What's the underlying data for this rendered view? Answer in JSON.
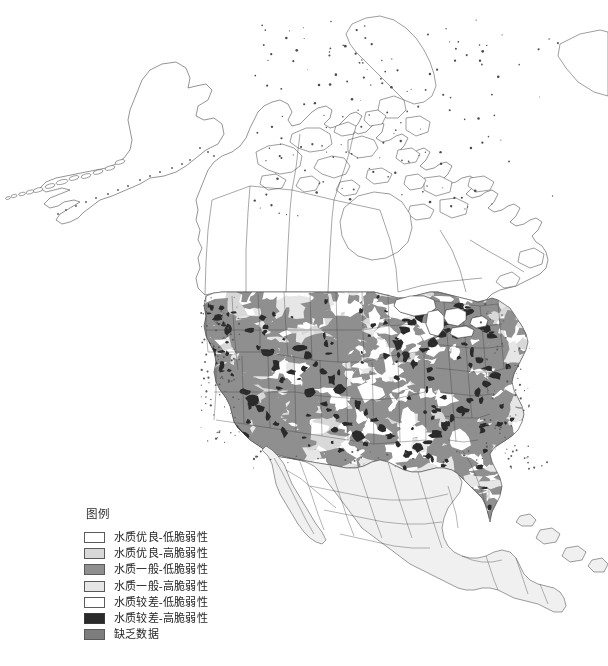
{
  "figure": {
    "kind": "choropleth-map",
    "region": "North America",
    "background_color": "#ffffff",
    "outline_color": "#3c3c3c",
    "water_color": "#ffffff"
  },
  "legend": {
    "title": "图例",
    "items": [
      {
        "label": "水质优良-低脆弱性",
        "color": "#ffffff",
        "border": "#5a5a5a",
        "key": "good-quality-low-vulnerability"
      },
      {
        "label": "水质优良-高脆弱性",
        "color": "#d8d8d8",
        "border": "#5a5a5a",
        "key": "good-quality-high-vulnerability"
      },
      {
        "label": "水质一般-低脆弱性",
        "color": "#8f8f8f",
        "border": "#5a5a5a",
        "key": "fair-quality-low-vulnerability"
      },
      {
        "label": "水质一般-高脆弱性",
        "color": "#e6e6e6",
        "border": "#5a5a5a",
        "key": "fair-quality-high-vulnerability"
      },
      {
        "label": "水质较差-低脆弱性",
        "color": "#ffffff",
        "border": "#5a5a5a",
        "key": "poor-quality-low-vulnerability"
      },
      {
        "label": "水质较差-高脆弱性",
        "color": "#2a2a2a",
        "border": "#3a3a3a",
        "key": "poor-quality-high-vulnerability"
      },
      {
        "label": "缺乏数据",
        "color": "#7d7d7d",
        "border": "#5a5a5a",
        "key": "no-data"
      }
    ]
  },
  "map_regions": [
    {
      "name": "Alaska",
      "fill": "#ffffff",
      "note": "outline only, no classification fill"
    },
    {
      "name": "Canada",
      "fill": "#ffffff",
      "note": "outline only with province boundaries"
    },
    {
      "name": "Canadian Arctic Archipelago",
      "fill": "#ffffff",
      "note": "outline only"
    },
    {
      "name": "Greenland (partial)",
      "fill": "#ffffff",
      "note": "edge of frame"
    },
    {
      "name": "Conterminous United States",
      "fill": "mixed",
      "note": "classified mosaic of all seven legend classes"
    },
    {
      "name": "Mexico",
      "fill": "#f0f0f0",
      "note": "light uniform fill with state boundaries"
    },
    {
      "name": "Central America",
      "fill": "#f0f0f0",
      "note": "light uniform fill"
    },
    {
      "name": "Caribbean Islands",
      "fill": "#f0f0f0",
      "note": "light uniform fill"
    }
  ]
}
